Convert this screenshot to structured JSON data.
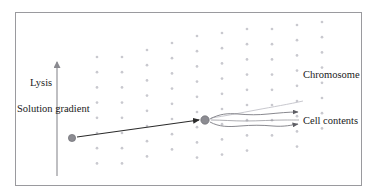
{
  "figure": {
    "title": "",
    "background_color": "#ffffff",
    "frame": {
      "x": 15,
      "y": 12,
      "width": 347,
      "height": 174,
      "stroke": "#9a9a9e",
      "stroke_width": 1
    }
  },
  "labels": {
    "lysis": "Lysis",
    "solution_gradient": "Solution gradient",
    "chromosome": "Chromosome",
    "cell_contents": "Cell contents"
  },
  "colors": {
    "text": "#1a1a1a",
    "frame": "#9a9a9e",
    "dot": "#c9c9cf",
    "cell": "#8c8c92",
    "cell_stroke": "#6e6e74",
    "arrow_dark": "#2b2b2b",
    "arrow_gray": "#8a8a90",
    "gradient_axis": "#8a8a90"
  },
  "gradient_axis": {
    "name": "solution-gradient-axis",
    "x": 57,
    "y_bottom": 176,
    "y_top": 60,
    "direction": "up",
    "stroke": "#8a8a90"
  },
  "dot_grid": {
    "description": "staggered columns of light gray dots forming a density gradient",
    "dot_radius": 1.35,
    "color": "#c9c9cf",
    "col_spacing": 25,
    "row_spacing": 15.2,
    "x_start": 97,
    "columns": [
      {
        "index": 0,
        "x": 97,
        "y_top": 57,
        "y_bottom": 177
      },
      {
        "index": 1,
        "x": 122,
        "y_top": 57,
        "y_bottom": 170
      },
      {
        "index": 2,
        "x": 147,
        "y_top": 50,
        "y_bottom": 170
      },
      {
        "index": 3,
        "x": 172,
        "y_top": 43,
        "y_bottom": 163
      },
      {
        "index": 4,
        "x": 197,
        "y_top": 36,
        "y_bottom": 163
      },
      {
        "index": 5,
        "x": 222,
        "y_top": 33,
        "y_bottom": 156
      },
      {
        "index": 6,
        "x": 247,
        "y_top": 29,
        "y_bottom": 156
      },
      {
        "index": 7,
        "x": 272,
        "y_top": 29,
        "y_bottom": 149
      },
      {
        "index": 8,
        "x": 297,
        "y_top": 25,
        "y_bottom": 149
      },
      {
        "index": 9,
        "x": 322,
        "y_top": 22,
        "y_bottom": 141
      }
    ]
  },
  "cells": [
    {
      "name": "cell-start",
      "cx": 72,
      "cy": 138,
      "r": 3.6,
      "fill": "#8c8c92"
    },
    {
      "name": "cell-lysing",
      "cx": 205,
      "cy": 120,
      "r": 4.2,
      "fill": "#8c8c92"
    }
  ],
  "arrows": [
    {
      "name": "migration-arrow",
      "from": [
        77,
        137
      ],
      "to": [
        200,
        120
      ],
      "stroke": "#2b2b2b",
      "stroke_width": 1.2,
      "head": true
    },
    {
      "name": "chromosome-pointer",
      "stroke": "#b4b4ba",
      "stroke_width": 0.9,
      "head": false
    },
    {
      "name": "cell-contents-upper-arrow",
      "to": [
        302,
        112
      ],
      "stroke": "#6e6e74",
      "stroke_width": 0.9,
      "head": true
    },
    {
      "name": "cell-contents-lower-arrow",
      "to": [
        302,
        124
      ],
      "stroke": "#6e6e74",
      "stroke_width": 0.9,
      "head": true
    }
  ]
}
